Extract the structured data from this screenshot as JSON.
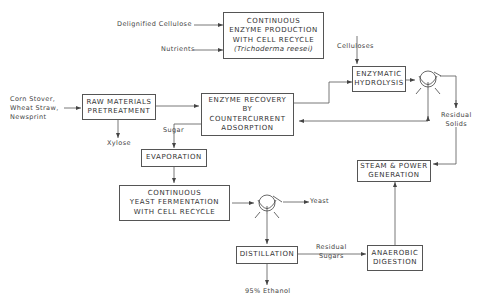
{
  "diagram": {
    "type": "process-flow",
    "boxes": {
      "enzyme_production": {
        "lines": [
          "CONTINUOUS",
          "ENZYME PRODUCTION",
          "WITH CELL RECYCLE",
          "(Trichoderma reesei)"
        ]
      },
      "raw_materials": {
        "lines": [
          "RAW MATERIALS",
          "PRETREATMENT"
        ]
      },
      "enzyme_recovery": {
        "lines": [
          "ENZYME RECOVERY",
          "BY",
          "COUNTERCURRENT",
          "ADSORPTION"
        ]
      },
      "enzymatic_hydrolysis": {
        "lines": [
          "ENZYMATIC",
          "HYDROLYSIS"
        ]
      },
      "evaporation": {
        "lines": [
          "EVAPORATION"
        ]
      },
      "yeast_fermentation": {
        "lines": [
          "CONTINUOUS",
          "YEAST FERMENTATION",
          "WITH CELL RECYCLE"
        ]
      },
      "steam_power": {
        "lines": [
          "STEAM & POWER",
          "GENERATION"
        ]
      },
      "distillation": {
        "lines": [
          "DISTILLATION"
        ]
      },
      "anaerobic_digestion": {
        "lines": [
          "ANAEROBIC",
          "DIGESTION"
        ]
      }
    },
    "labels": {
      "delignified_cellulose": "Delignified Cellulose",
      "nutrients": "Nutrients",
      "cellulases": "Celluloses",
      "feedstock": [
        "Corn Stover,",
        "Wheat Straw,",
        "Newsprint"
      ],
      "xylose": "Xylose",
      "sugar": "Sugar",
      "residual_solids": [
        "Residual",
        "Solids"
      ],
      "yeast": "Yeast",
      "residual_sugars": [
        "Residual",
        "Sugars"
      ],
      "ethanol": "95% Ethanol"
    },
    "separators": [
      "centrifuge-after-hydrolysis",
      "centrifuge-after-fermentation"
    ],
    "colors": {
      "line": "#555555",
      "text": "#333333",
      "background": "#ffffff"
    }
  }
}
